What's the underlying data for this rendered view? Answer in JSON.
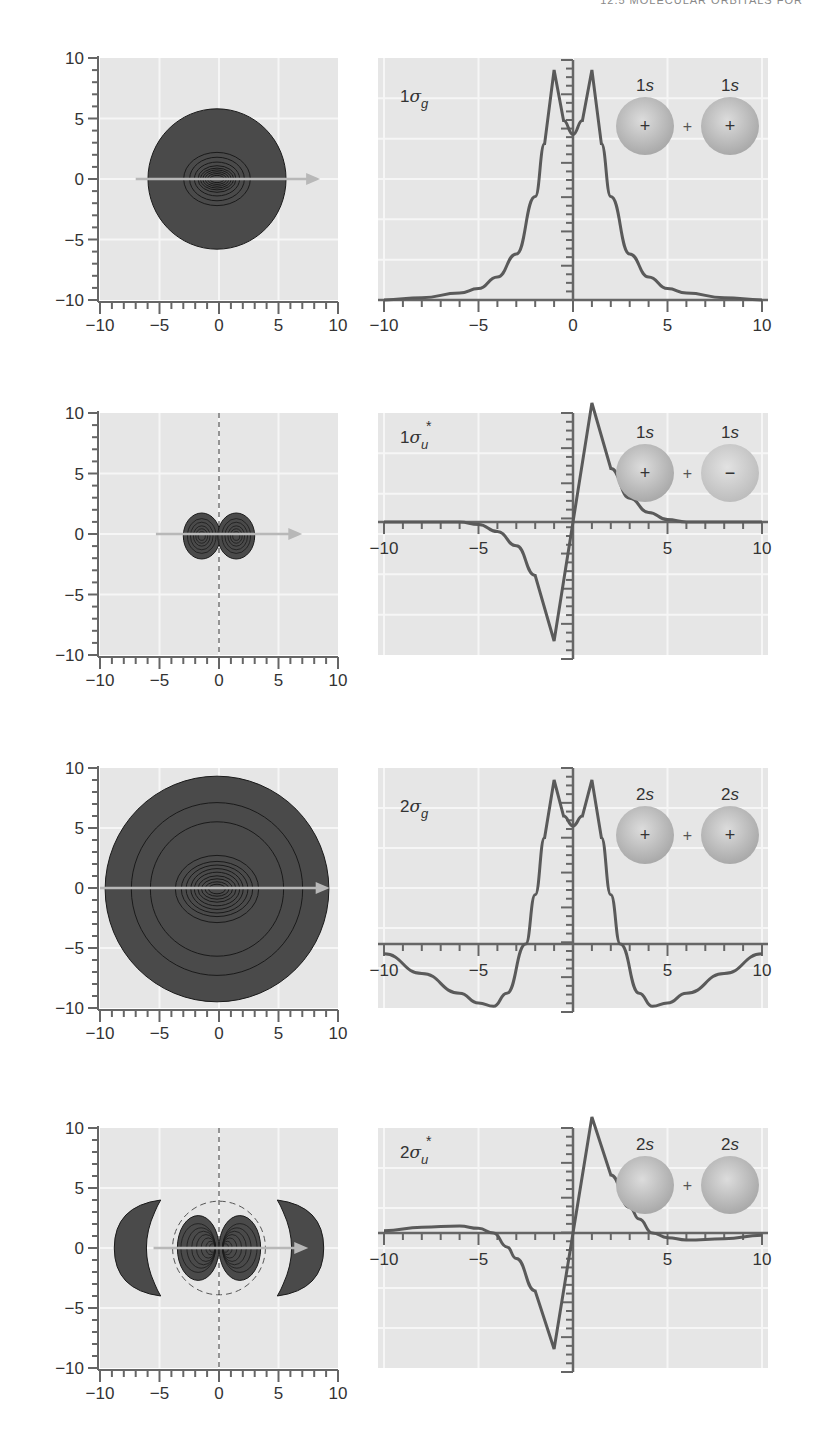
{
  "header": {
    "running_title": "12.5 MOLECULAR ORBITALS FOR"
  },
  "colors": {
    "panel_bg": "#e6e6e6",
    "grid": "#f6f6f6",
    "axis": "#666666",
    "curve": "#5a5a5a",
    "contour_fill": "#4a4a4a",
    "contour_line": "#1a1a1a",
    "arrow": "#b8b8b8",
    "sphere_light": "#d8d8d8",
    "sphere_dark": "#a8a8a8"
  },
  "chart_data": [
    {
      "type": "contour",
      "id": "1sigma_g_contour",
      "orbital": "1σg",
      "xlim": [
        -10,
        10
      ],
      "ylim": [
        -10,
        10
      ],
      "x_ticks": [
        "-10",
        "-5",
        "0",
        "5",
        "10"
      ],
      "y_ticks": [
        "10",
        "5",
        "0",
        "-5",
        "-10"
      ],
      "grid": true,
      "outer_radius": 5.8,
      "nodal_planes": [],
      "description": "single circular region centered at origin, nested elliptical contours, arrow along +x axis"
    },
    {
      "type": "line",
      "id": "1sigma_g_profile",
      "label": "1σg",
      "label_main": "1σ",
      "label_sub": "g",
      "label_sup": "",
      "xlim": [
        -10,
        10
      ],
      "x_ticks": [
        "-10",
        "-5",
        "0",
        "5",
        "10"
      ],
      "baseline": "bottom",
      "grid": true,
      "x": [
        -10,
        -8,
        -6,
        -5,
        -4,
        -3,
        -2,
        -1.5,
        -1,
        -0.5,
        0,
        0.5,
        1,
        1.5,
        2,
        3,
        4,
        5,
        6,
        8,
        10
      ],
      "y": [
        0.0,
        0.01,
        0.03,
        0.05,
        0.1,
        0.2,
        0.45,
        0.68,
        1.0,
        0.78,
        0.72,
        0.78,
        1.0,
        0.68,
        0.45,
        0.2,
        0.1,
        0.05,
        0.03,
        0.01,
        0.0
      ],
      "inset": {
        "left_label": "1s",
        "right_label": "1s",
        "left_sign": "+",
        "right_sign": "+",
        "operator": "+"
      }
    },
    {
      "type": "contour",
      "id": "1sigma_u_star_contour",
      "orbital": "1σu*",
      "xlim": [
        -10,
        10
      ],
      "ylim": [
        -10,
        10
      ],
      "x_ticks": [
        "-10",
        "-5",
        "0",
        "5",
        "10"
      ],
      "y_ticks": [
        "10",
        "5",
        "0",
        "-5",
        "-10"
      ],
      "grid": true,
      "nodal_planes": [
        "x = 0 (dashed vertical)"
      ],
      "description": "two small lobes at x≈±1.5, radius≈1.8, separated by a dashed nodal plane"
    },
    {
      "type": "line",
      "id": "1sigma_u_star_profile",
      "label": "1σu*",
      "label_main": "1σ",
      "label_sub": "u",
      "label_sup": "*",
      "xlim": [
        -10,
        10
      ],
      "ylim": [
        -1,
        1
      ],
      "x_ticks": [
        "-10",
        "-5",
        "5",
        "10"
      ],
      "baseline": "middle",
      "grid": true,
      "x": [
        -10,
        -6,
        -5,
        -4,
        -3,
        -2,
        -1,
        0,
        1,
        2,
        3,
        4,
        5,
        6,
        10
      ],
      "y": [
        0,
        0,
        -0.02,
        -0.08,
        -0.2,
        -0.45,
        -1.0,
        0,
        1.0,
        0.45,
        0.2,
        0.08,
        0.02,
        0,
        0
      ],
      "inset": {
        "left_label": "1s",
        "right_label": "1s",
        "left_sign": "+",
        "right_sign": "−",
        "operator": "+"
      }
    },
    {
      "type": "contour",
      "id": "2sigma_g_contour",
      "orbital": "2σg",
      "xlim": [
        -10,
        10
      ],
      "ylim": [
        -10,
        10
      ],
      "x_ticks": [
        "-10",
        "-5",
        "0",
        "5",
        "10"
      ],
      "y_ticks": [
        "10",
        "5",
        "0",
        "-5",
        "-10"
      ],
      "grid": true,
      "outer_radius": 9.4,
      "nodal_planes": [],
      "description": "large circular region, concentric contour rings at r≈7.3, 5.6, dense elliptical contours near origin, arrow along +x axis"
    },
    {
      "type": "line",
      "id": "2sigma_g_profile",
      "label": "2σg",
      "label_main": "2σ",
      "label_sub": "g",
      "label_sup": "",
      "xlim": [
        -10,
        10
      ],
      "x_ticks": [
        "-10",
        "-5",
        "5",
        "10"
      ],
      "baseline": "lower",
      "grid": true,
      "x": [
        -10,
        -8,
        -6,
        -5,
        -4.2,
        -3.5,
        -2.5,
        -2,
        -1.5,
        -1,
        -0.5,
        0,
        0.5,
        1,
        1.5,
        2,
        2.5,
        3.5,
        4.2,
        5,
        6,
        8,
        10
      ],
      "y": [
        -0.06,
        -0.18,
        -0.3,
        -0.36,
        -0.38,
        -0.3,
        0.0,
        0.3,
        0.65,
        1.0,
        0.78,
        0.72,
        0.78,
        1.0,
        0.65,
        0.3,
        0.0,
        -0.3,
        -0.38,
        -0.36,
        -0.3,
        -0.18,
        -0.06
      ],
      "inset": {
        "left_label": "2s",
        "right_label": "2s",
        "left_sign": "+",
        "right_sign": "+",
        "operator": "+"
      }
    },
    {
      "type": "contour",
      "id": "2sigma_u_star_contour",
      "orbital": "2σu*",
      "xlim": [
        -10,
        10
      ],
      "ylim": [
        -10,
        10
      ],
      "x_ticks": [
        "-10",
        "-5",
        "0",
        "5",
        "10"
      ],
      "y_ticks": [
        "10",
        "5",
        "0",
        "-5",
        "-10"
      ],
      "grid": true,
      "nodal_planes": [
        "x = 0 (dashed vertical)",
        "circle r≈3.9 (dashed)"
      ],
      "description": "two inner lobes at x≈±1.5 plus two outer crescent lobes at x≈±6.5"
    },
    {
      "type": "line",
      "id": "2sigma_u_star_profile",
      "label": "2σu*",
      "label_main": "2σ",
      "label_sub": "u",
      "label_sup": "*",
      "xlim": [
        -10,
        10
      ],
      "ylim": [
        -1,
        1
      ],
      "x_ticks": [
        "-10",
        "-5",
        "5",
        "10"
      ],
      "baseline": "middle",
      "grid": true,
      "x": [
        -10,
        -8,
        -6,
        -5,
        -4.2,
        -3.5,
        -3,
        -2,
        -1,
        0,
        1,
        2,
        3,
        3.5,
        4.2,
        5,
        6,
        8,
        10
      ],
      "y": [
        0.02,
        0.05,
        0.06,
        0.04,
        0.0,
        -0.12,
        -0.22,
        -0.5,
        -1.0,
        0,
        1.0,
        0.5,
        0.22,
        0.12,
        0.0,
        -0.04,
        -0.06,
        -0.05,
        -0.02
      ],
      "inset": {
        "left_label": "2s",
        "right_label": "2s",
        "left_sign": "",
        "right_sign": "",
        "operator": "+"
      }
    }
  ]
}
